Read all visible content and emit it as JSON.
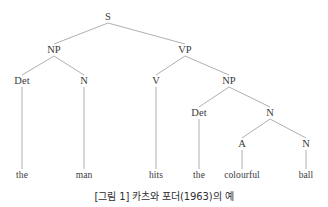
{
  "figure": {
    "caption": "[그림 1] 카츠와 포더(1963)의 예",
    "background_color": "#ffffff",
    "text_color": "#3a3a3a",
    "line_color": "#9a9a9a"
  },
  "tree": {
    "sentence": "the man hits the colourful ball",
    "nodes": [
      {
        "id": "s",
        "label": "S",
        "x": 108,
        "y": 17,
        "type": "nonterminal"
      },
      {
        "id": "np1",
        "label": "NP",
        "x": 54,
        "y": 50,
        "type": "nonterminal"
      },
      {
        "id": "vp",
        "label": "VP",
        "x": 185,
        "y": 50,
        "type": "nonterminal"
      },
      {
        "id": "det1",
        "label": "Det",
        "x": 22,
        "y": 81,
        "type": "nonterminal"
      },
      {
        "id": "n1",
        "label": "N",
        "x": 84,
        "y": 81,
        "type": "nonterminal"
      },
      {
        "id": "v",
        "label": "V",
        "x": 156,
        "y": 81,
        "type": "nonterminal"
      },
      {
        "id": "np2",
        "label": "NP",
        "x": 229,
        "y": 81,
        "type": "nonterminal"
      },
      {
        "id": "det2",
        "label": "Det",
        "x": 199,
        "y": 113,
        "type": "nonterminal"
      },
      {
        "id": "n2",
        "label": "N",
        "x": 270,
        "y": 113,
        "type": "nonterminal"
      },
      {
        "id": "a",
        "label": "A",
        "x": 242,
        "y": 144,
        "type": "nonterminal"
      },
      {
        "id": "n3",
        "label": "N",
        "x": 306,
        "y": 144,
        "type": "nonterminal"
      },
      {
        "id": "w_the1",
        "label": "the",
        "x": 22,
        "y": 176,
        "type": "terminal"
      },
      {
        "id": "w_man",
        "label": "man",
        "x": 84,
        "y": 176,
        "type": "terminal"
      },
      {
        "id": "w_hits",
        "label": "hits",
        "x": 156,
        "y": 176,
        "type": "terminal"
      },
      {
        "id": "w_the2",
        "label": "the",
        "x": 199,
        "y": 176,
        "type": "terminal"
      },
      {
        "id": "w_col",
        "label": "colourful",
        "x": 242,
        "y": 176,
        "type": "terminal"
      },
      {
        "id": "w_ball",
        "label": "ball",
        "x": 306,
        "y": 176,
        "type": "terminal"
      }
    ],
    "edges": [
      {
        "from": "s",
        "to": "np1"
      },
      {
        "from": "s",
        "to": "vp"
      },
      {
        "from": "np1",
        "to": "det1"
      },
      {
        "from": "np1",
        "to": "n1"
      },
      {
        "from": "vp",
        "to": "v"
      },
      {
        "from": "vp",
        "to": "np2"
      },
      {
        "from": "np2",
        "to": "det2"
      },
      {
        "from": "np2",
        "to": "n2"
      },
      {
        "from": "n2",
        "to": "a"
      },
      {
        "from": "n2",
        "to": "n3"
      },
      {
        "from": "det1",
        "to": "w_the1"
      },
      {
        "from": "n1",
        "to": "w_man"
      },
      {
        "from": "v",
        "to": "w_hits"
      },
      {
        "from": "det2",
        "to": "w_the2"
      },
      {
        "from": "a",
        "to": "w_col"
      },
      {
        "from": "n3",
        "to": "w_ball"
      }
    ]
  }
}
